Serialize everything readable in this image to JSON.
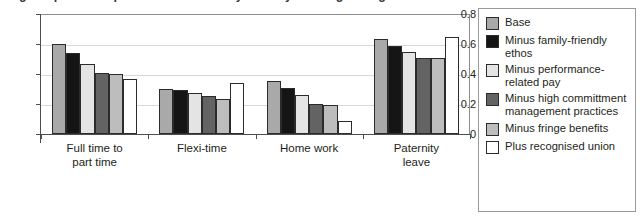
{
  "title": "Figure: predicted probabilities of family-friendly working arrangements",
  "legend": {
    "items": [
      {
        "label": "Base",
        "color": "#a9a9a9"
      },
      {
        "label": "Minus family-friendly ethos",
        "color": "#151515"
      },
      {
        "label": "Minus performance-related pay",
        "color": "#e4e4e4"
      },
      {
        "label": "Minus high committment management practices",
        "color": "#636363"
      },
      {
        "label": "Minus fringe benefits",
        "color": "#bdbdbd"
      },
      {
        "label": "Plus recognised union",
        "color": "#ffffff"
      }
    ]
  },
  "chart_data": {
    "type": "bar",
    "title": "",
    "xlabel": "",
    "ylabel": "",
    "ylim": [
      0,
      0.8
    ],
    "yticks": [
      "0",
      "0.2",
      "0.4",
      "0.6",
      "0.8"
    ],
    "ytick_values": [
      0,
      0.2,
      0.4,
      0.6,
      0.8
    ],
    "grid": true,
    "legend_position": "right",
    "categories": [
      "Full time to\npart time",
      "Flexi-time",
      "Home work",
      "Paternity\nleave"
    ],
    "series": [
      {
        "name": "Base",
        "color": "#a9a9a9",
        "values": [
          0.6,
          0.3,
          0.355,
          0.635
        ]
      },
      {
        "name": "Minus family-friendly ethos",
        "color": "#151515",
        "values": [
          0.54,
          0.295,
          0.305,
          0.59
        ]
      },
      {
        "name": "Minus performance-related pay",
        "color": "#e4e4e4",
        "values": [
          0.47,
          0.27,
          0.26,
          0.545
        ]
      },
      {
        "name": "Minus high committment management practices",
        "color": "#636363",
        "values": [
          0.41,
          0.25,
          0.2,
          0.505
        ]
      },
      {
        "name": "Minus fringe benefits",
        "color": "#bdbdbd",
        "values": [
          0.4,
          0.235,
          0.19,
          0.505
        ]
      },
      {
        "name": "Plus recognised union",
        "color": "#ffffff",
        "values": [
          0.365,
          0.34,
          0.085,
          0.645
        ]
      }
    ]
  }
}
